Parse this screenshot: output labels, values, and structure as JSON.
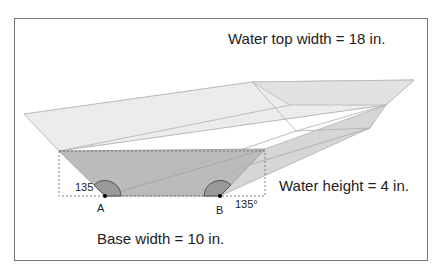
{
  "labels": {
    "water_top_width": "Water top width = 18 in.",
    "water_height": "Water height  = 4 in.",
    "base_width": "Base width = 10 in.",
    "angle_a": "135",
    "angle_b": "135°",
    "point_a": "A",
    "point_b": "B"
  },
  "colors": {
    "frame": "#777777",
    "outer_face": "#e6e6e6",
    "water_face": "#b4b4b4",
    "edge": "#a0a0a0",
    "angle_arc": "#555555"
  }
}
